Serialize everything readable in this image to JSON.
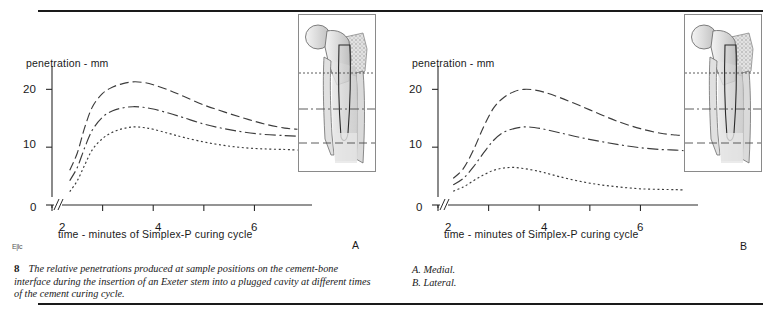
{
  "figure": {
    "number": "8",
    "caption": "The relative penetrations produced at sample positions on the cement-bone interface during the insertion of an Exeter stem into a plugged cavity at different times of the cement curing cycle.",
    "side_notes": [
      "A. Medial.",
      "B. Lateral."
    ],
    "corner_mark": "E|Ic"
  },
  "panels": {
    "a": {
      "letter": "A",
      "y_title": "penetration - mm",
      "x_title": "time - minutes of Simplex-P curing cycle",
      "y_ticks": [
        "0",
        "10",
        "20"
      ],
      "x_ticks": [
        "2",
        "4",
        "6"
      ],
      "inset_name": "femoral-stem-medial"
    },
    "b": {
      "letter": "B",
      "y_title": "penetration - mm",
      "x_title": "time - minutes of Simplex-P curing cycle",
      "y_ticks": [
        "0",
        "10",
        "20"
      ],
      "x_ticks": [
        "2",
        "4",
        "6"
      ],
      "inset_name": "femoral-stem-lateral"
    }
  },
  "chart_data": [
    {
      "type": "line",
      "panel": "A",
      "title": "A. Medial.",
      "xlabel": "time - minutes of Simplex-P curing cycle",
      "ylabel": "penetration - mm",
      "xlim": [
        2.0,
        6.9
      ],
      "ylim": [
        0,
        23
      ],
      "xticks": [
        2,
        3,
        4,
        5,
        6
      ],
      "xticklabels": [
        "2",
        "",
        "4",
        "",
        "6"
      ],
      "yticks": [
        0,
        10,
        20
      ],
      "grid": false,
      "legend": false,
      "axis_break_x": true,
      "axis_break_y": true,
      "x": [
        2.35,
        2.5,
        2.65,
        2.8,
        3.0,
        3.2,
        3.4,
        3.6,
        3.8,
        4.0,
        4.3,
        4.6,
        5.0,
        5.4,
        5.8,
        6.2,
        6.6,
        6.85
      ],
      "series": [
        {
          "name": "proximal-sample",
          "style": "long-dash",
          "values": [
            6.0,
            9.0,
            13.5,
            17.0,
            19.3,
            20.4,
            21.0,
            21.3,
            21.2,
            20.8,
            19.9,
            18.8,
            17.3,
            16.1,
            15.0,
            14.0,
            13.3,
            13.1
          ]
        },
        {
          "name": "mid-sample",
          "style": "dash-dot",
          "values": [
            4.2,
            6.5,
            10.0,
            13.0,
            15.2,
            16.3,
            16.8,
            17.0,
            16.9,
            16.6,
            15.9,
            15.1,
            14.0,
            13.2,
            12.6,
            12.2,
            12.0,
            11.9
          ]
        },
        {
          "name": "distal-sample",
          "style": "dotted",
          "values": [
            2.3,
            4.2,
            7.0,
            9.6,
            11.5,
            12.6,
            13.2,
            13.5,
            13.4,
            13.1,
            12.4,
            11.7,
            10.9,
            10.3,
            9.9,
            9.7,
            9.6,
            9.5
          ]
        }
      ]
    },
    {
      "type": "line",
      "panel": "B",
      "title": "B. Lateral.",
      "xlabel": "time - minutes of Simplex-P curing cycle",
      "ylabel": "penetration - mm",
      "xlim": [
        2.0,
        6.9
      ],
      "ylim": [
        0,
        23
      ],
      "xticks": [
        2,
        3,
        4,
        5,
        6
      ],
      "xticklabels": [
        "2",
        "",
        "4",
        "",
        "6"
      ],
      "yticks": [
        0,
        10,
        20
      ],
      "grid": false,
      "legend": false,
      "axis_break_x": true,
      "axis_break_y": true,
      "x": [
        2.3,
        2.5,
        2.7,
        2.9,
        3.1,
        3.3,
        3.5,
        3.7,
        3.9,
        4.1,
        4.4,
        4.8,
        5.2,
        5.6,
        6.0,
        6.4,
        6.7,
        6.85
      ],
      "series": [
        {
          "name": "proximal-sample",
          "style": "long-dash",
          "values": [
            4.6,
            6.3,
            9.5,
            13.5,
            16.8,
            18.6,
            19.6,
            20.0,
            19.9,
            19.5,
            18.6,
            17.2,
            15.7,
            14.3,
            13.2,
            12.4,
            12.1,
            12.0
          ]
        },
        {
          "name": "mid-sample",
          "style": "dash-dot",
          "values": [
            3.5,
            4.6,
            6.6,
            9.0,
            11.2,
            12.6,
            13.2,
            13.5,
            13.4,
            13.1,
            12.5,
            11.7,
            11.0,
            10.4,
            9.9,
            9.6,
            9.5,
            9.4
          ]
        },
        {
          "name": "distal-sample",
          "style": "dotted",
          "values": [
            2.4,
            3.1,
            4.2,
            5.2,
            6.0,
            6.4,
            6.5,
            6.3,
            6.0,
            5.6,
            4.9,
            4.1,
            3.5,
            3.1,
            2.8,
            2.7,
            2.65,
            2.6
          ]
        }
      ]
    }
  ]
}
